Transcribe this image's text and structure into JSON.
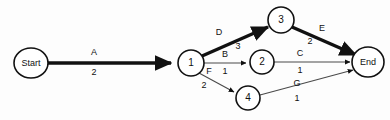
{
  "diagram": {
    "type": "activity-on-arrow-network",
    "title": "",
    "background_color": "#fdfdfd",
    "ink_color": "#111111",
    "critical_path_color": "#111111",
    "normal_edge_color": "#4a4a4a",
    "nodes": [
      {
        "id": "start",
        "label": "Start",
        "cx": 31,
        "cy": 63,
        "rx": 17,
        "ry": 15,
        "kind": "terminal"
      },
      {
        "id": "n1",
        "label": "1",
        "cx": 191,
        "cy": 63,
        "rx": 13,
        "ry": 13,
        "kind": "numbered"
      },
      {
        "id": "n3",
        "label": "3",
        "cx": 281,
        "cy": 20,
        "rx": 13,
        "ry": 13,
        "kind": "numbered"
      },
      {
        "id": "n2",
        "label": "2",
        "cx": 262,
        "cy": 62,
        "rx": 12,
        "ry": 12,
        "kind": "numbered"
      },
      {
        "id": "n4",
        "label": "4",
        "cx": 248,
        "cy": 98,
        "rx": 12,
        "ry": 12,
        "kind": "numbered"
      },
      {
        "id": "end",
        "label": "End",
        "cx": 368,
        "cy": 62,
        "rx": 16,
        "ry": 15,
        "kind": "terminal"
      }
    ],
    "edges": [
      {
        "id": "edge-a",
        "activity": "A",
        "duration": "2",
        "from": "start",
        "to": "n1",
        "critical": true,
        "label_x": 94,
        "label_y": 53,
        "weight_x": 94,
        "weight_y": 73
      },
      {
        "id": "edge-d",
        "activity": "D",
        "duration": "3",
        "from": "n1",
        "to": "n3",
        "critical": true,
        "label_x": 219,
        "label_y": 33,
        "weight_x": 238,
        "weight_y": 47
      },
      {
        "id": "edge-b",
        "activity": "B",
        "duration": "1",
        "from": "n1",
        "to": "n2",
        "critical": false,
        "label_x": 225,
        "label_y": 55,
        "weight_x": 225,
        "weight_y": 72
      },
      {
        "id": "edge-f",
        "activity": "F",
        "duration": "2",
        "from": "n1",
        "to": "n4",
        "critical": false,
        "label_x": 209,
        "label_y": 72,
        "weight_x": 204,
        "weight_y": 86
      },
      {
        "id": "edge-e",
        "activity": "E",
        "duration": "2",
        "from": "n3",
        "to": "end",
        "critical": true,
        "label_x": 322,
        "label_y": 29,
        "weight_x": 310,
        "weight_y": 42
      },
      {
        "id": "edge-c",
        "activity": "C",
        "duration": "1",
        "from": "n2",
        "to": "end",
        "critical": false,
        "label_x": 300,
        "label_y": 54,
        "weight_x": 300,
        "weight_y": 71
      },
      {
        "id": "edge-g",
        "activity": "G",
        "duration": "1",
        "from": "n4",
        "to": "end",
        "critical": false,
        "label_x": 297,
        "label_y": 84,
        "weight_x": 297,
        "weight_y": 99
      }
    ],
    "critical_path_sequence": "Start - 1 - 3 - End"
  }
}
